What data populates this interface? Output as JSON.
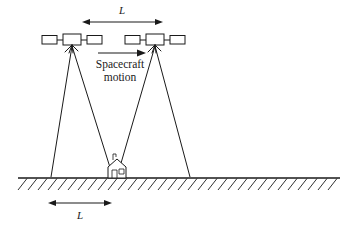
{
  "figure": {
    "colors": {
      "ink": "#1a1a1a",
      "background": "#ffffff"
    }
  },
  "labels": {
    "baseline_top": "L",
    "baseline_ground": "L",
    "motion_line1": "Spacecraft",
    "motion_line2": "motion"
  },
  "geometry": {
    "top_dimension": {
      "x1": 82,
      "x2": 163,
      "y": 22,
      "label_y": 11
    },
    "ground_dimension": {
      "x1": 48,
      "x2": 112,
      "y": 203,
      "label_y": 216
    },
    "motion_arrow": {
      "x1": 98,
      "x2": 145,
      "y": 53
    },
    "ground_line": {
      "x1": 18,
      "x2": 340,
      "y": 178
    },
    "spacecraft": [
      {
        "id": "left",
        "apex_x": 72,
        "apex_y": 44
      },
      {
        "id": "right",
        "apex_x": 155,
        "apex_y": 44
      }
    ],
    "target": {
      "x": 117,
      "y": 170
    },
    "beams": [
      {
        "from": 72,
        "left_ground": 51,
        "right_ground": 113
      },
      {
        "from": 155,
        "left_ground": 117,
        "right_ground": 190
      }
    ]
  }
}
